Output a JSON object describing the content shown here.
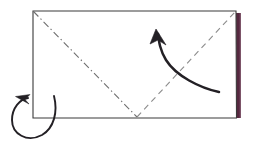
{
  "figure": {
    "title": "Origami fold step diagram",
    "background_color": "#ffffff"
  },
  "paper": {
    "name": "rectangular sheet",
    "face_color": "#ffffff",
    "outline_color": "#3a3a3a",
    "outline_width": 1.1,
    "corners": {
      "top_left": [
        33,
        11
      ],
      "top_right": [
        236,
        11
      ],
      "bottom_right": [
        236.5,
        118
      ],
      "bottom_left": [
        33,
        118
      ]
    },
    "width_px": 203,
    "height_px": 107
  },
  "colored_edge": {
    "name": "reverse side colored edge",
    "color": "#55283f",
    "highlight_color": "#70415a",
    "shadow_color": "#33161f",
    "x": 238.5,
    "y_top": 13,
    "y_bottom": 118,
    "thickness": 4.2
  },
  "creases": [
    {
      "id": "mountain-crease",
      "label": "Mountain fold",
      "line_style": "dash-dot",
      "color": "#6e6e6e",
      "dash_pattern": "7 3 1.4 3",
      "from": [
        33.5,
        11.5
      ],
      "to": [
        137,
        117
      ]
    },
    {
      "id": "valley-crease",
      "label": "Valley fold",
      "line_style": "dashed",
      "color": "#8c8c8c",
      "dash_pattern": "6 4.5",
      "from": [
        137,
        117
      ],
      "to": [
        235.5,
        11.5
      ]
    }
  ],
  "arrows": [
    {
      "id": "fold-arrow",
      "label": "Fold up and to the left",
      "style": "solid curved arrow",
      "color": "#232025",
      "stroke_width": 2.5,
      "path": "M 219,92 C 200,88 176,76 166,60 C 160,50 159,42 158,34",
      "head_tip": [
        156,
        29
      ],
      "head_polygon": "156,29 150,44 158,40 166,45",
      "direction": "up-left"
    },
    {
      "id": "turn-over-arrow",
      "label": "Turn the model over",
      "style": "solid loop arrow",
      "color": "#232025",
      "stroke_width": 1.9,
      "path": "M 54,96 C 58,112 54,128 42,135 C 27,143 12,134 12,120 C 12,108 20,99 28,98",
      "head_tip": [
        15.5,
        96.5
      ],
      "head_polygon": "15.5,96.5 30,94.5 25,99.5 29,104",
      "direction": "counter-clockwise"
    }
  ],
  "legend": {
    "mountain_label": "Mountain fold (dash-dot)",
    "valley_label": "Valley fold (dashed)",
    "fold_arrow_label": "Fold direction",
    "turn_label": "Turn over"
  }
}
